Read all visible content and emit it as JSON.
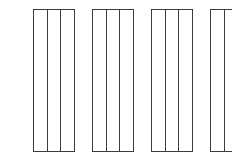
{
  "canvas": {
    "width": 232,
    "height": 166,
    "background_color": "#ffffff"
  },
  "diagram": {
    "title": "",
    "kind": "line-drawing",
    "stroke_color": "#3c3c3c",
    "fill_color": "#ffffff",
    "stroke_width": 1.1,
    "panel_count": 4,
    "columns_per_panel": 3,
    "dividers_per_panel": 2,
    "geometry": {
      "top_y": 9,
      "bottom_y": 151,
      "panel_height": 142,
      "panel_width": 41,
      "gap_between_panels": 18,
      "panel_left_edges": [
        33,
        92,
        151,
        210
      ],
      "column_width": 13.6667
    },
    "panels": [
      {
        "index": 1,
        "name": "panel-1",
        "x": 33,
        "y": 9,
        "width": 41,
        "height": 142,
        "divider_offsets": [
          13.6667,
          27.3333
        ]
      },
      {
        "index": 2,
        "name": "panel-2",
        "x": 92,
        "y": 9,
        "width": 41,
        "height": 142,
        "divider_offsets": [
          13.6667,
          27.3333
        ]
      },
      {
        "index": 3,
        "name": "panel-3",
        "x": 151,
        "y": 9,
        "width": 41,
        "height": 142,
        "divider_offsets": [
          13.6667,
          27.3333
        ]
      },
      {
        "index": 4,
        "name": "panel-4",
        "x": 210,
        "y": 9,
        "width": 41,
        "height": 142,
        "divider_offsets": [
          13.6667,
          27.3333
        ]
      }
    ]
  }
}
